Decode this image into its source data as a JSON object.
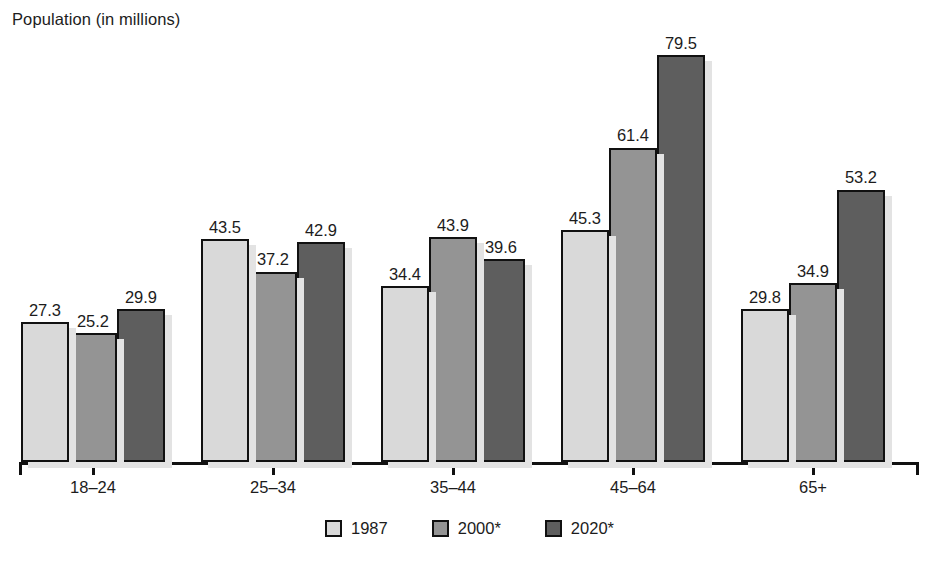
{
  "chart_data": {
    "type": "bar",
    "title": "",
    "ylabel": "Population (in millions)",
    "xlabel": "",
    "categories": [
      "18–24",
      "25–34",
      "35–44",
      "45–64",
      "65+"
    ],
    "series": [
      {
        "name": "1987",
        "color": "#d9d9d9",
        "values": [
          27.3,
          43.5,
          34.4,
          45.3,
          29.8
        ]
      },
      {
        "name": "2000*",
        "color": "#949494",
        "values": [
          25.2,
          37.2,
          43.9,
          61.4,
          34.9
        ]
      },
      {
        "name": "2020*",
        "color": "#5e5e5e",
        "values": [
          29.9,
          42.9,
          39.6,
          79.5,
          53.2
        ]
      }
    ],
    "value_labels": [
      [
        "27.3",
        "25.2",
        "29.9"
      ],
      [
        "43.5",
        "37.2",
        "42.9"
      ],
      [
        "34.4",
        "43.9",
        "39.6"
      ],
      [
        "45.3",
        "61.4",
        "79.5"
      ],
      [
        "29.8",
        "34.9",
        "53.2"
      ]
    ],
    "ylim": [
      0,
      84
    ],
    "grid": false,
    "legend_position": "bottom",
    "legend_entries": [
      "1987",
      "2000*",
      "2020*"
    ],
    "axis_line_color": "#111111",
    "bar_border_color": "#111111",
    "shadow_color": "#e3e3e3"
  },
  "axis": {
    "y_title": "Population (in millions)",
    "x_tick_labels": [
      "18–24",
      "25–34",
      "35–44",
      "45–64",
      "65+"
    ]
  },
  "legend": {
    "items": [
      {
        "label": "1987"
      },
      {
        "label": "2000*"
      },
      {
        "label": "2020*"
      }
    ]
  }
}
